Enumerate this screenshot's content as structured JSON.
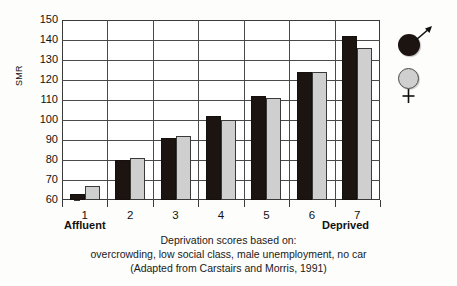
{
  "chart_data": {
    "type": "bar",
    "title": "",
    "xlabel": "",
    "ylabel": "SMR",
    "ylim": [
      60,
      150
    ],
    "ytick_step": 10,
    "grid": true,
    "legend_position": "right",
    "categories": [
      "1",
      "2",
      "3",
      "4",
      "5",
      "6",
      "7"
    ],
    "ytick_labels": [
      "150",
      "140",
      "130",
      "120",
      "110",
      "100",
      "90",
      "80",
      "70",
      "60"
    ],
    "series": [
      {
        "name": "male",
        "symbol": "male-symbol",
        "color": "#1c1410",
        "values": [
          63,
          80,
          91,
          102,
          112,
          124,
          142
        ]
      },
      {
        "name": "female",
        "symbol": "female-symbol",
        "color": "#cfcfcf",
        "values": [
          67,
          81,
          92,
          100,
          111,
          124,
          136
        ]
      }
    ],
    "annotations": {
      "axis_start_label": "Affluent",
      "axis_end_label": "Deprived"
    },
    "caption_lines": [
      "Deprivation scores based on:",
      "overcrowding, low social class, male unemployment, no car",
      "(Adapted from Carstairs and Morris, 1991)"
    ]
  },
  "legend": {
    "male_label": "male-symbol",
    "female_label": "female-symbol"
  },
  "colors": {
    "male_bar": "#1c1410",
    "female_bar": "#cfcfcf",
    "axis": "#3a3a3a",
    "background": "#fdfdfb"
  }
}
